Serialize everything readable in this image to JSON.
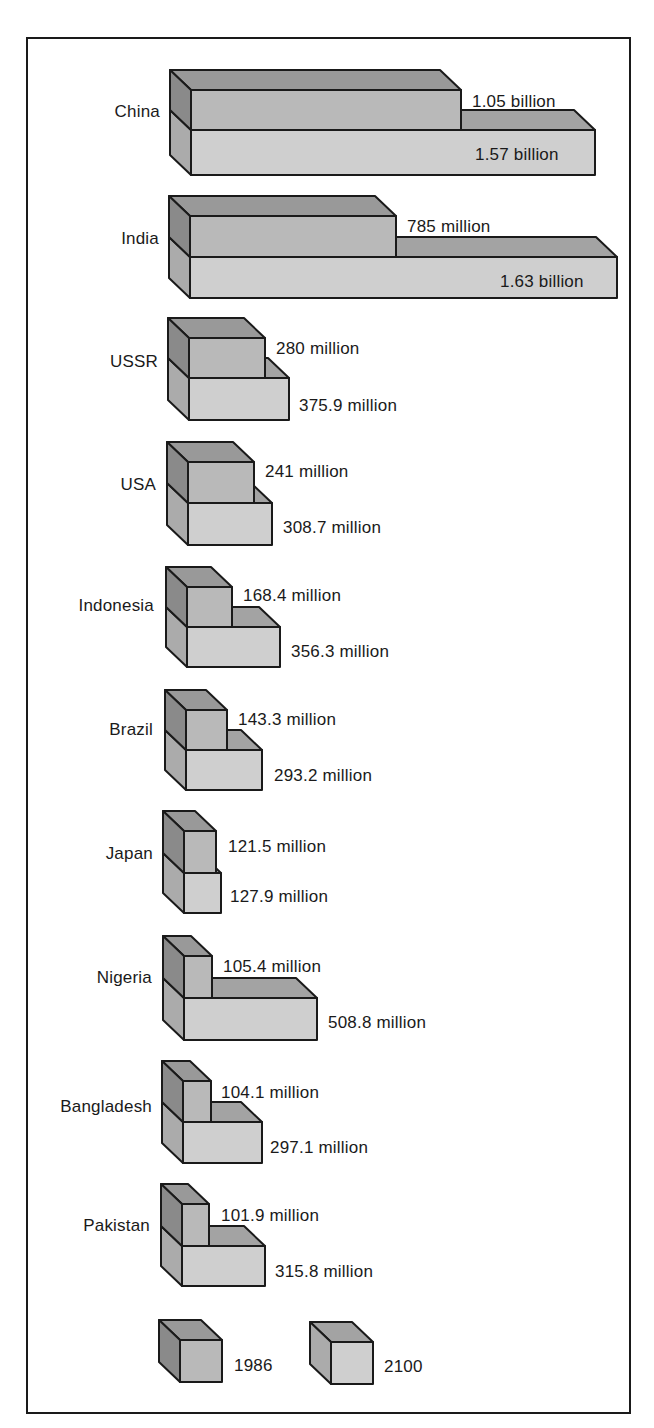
{
  "chart_data": {
    "type": "bar",
    "style": "3d-stacked-blocks",
    "title": "",
    "xlabel": "",
    "ylabel": "",
    "grid": false,
    "legend_position": "bottom",
    "units": "people",
    "categories": [
      "China",
      "India",
      "USSR",
      "USA",
      "Indonesia",
      "Brazil",
      "Japan",
      "Nigeria",
      "Bangladesh",
      "Pakistan"
    ],
    "series": [
      {
        "name": "1986",
        "values": [
          1050000000,
          785000000,
          280000000,
          241000000,
          168400000,
          143300000,
          121500000,
          105400000,
          104100000,
          101900000
        ],
        "labels": [
          "1.05 billion",
          "785 million",
          "280 million",
          "241 million",
          "168.4 million",
          "143.3 million",
          "121.5 million",
          "105.4 million",
          "104.1 million",
          "101.9 million"
        ]
      },
      {
        "name": "2100",
        "values": [
          1570000000,
          1630000000,
          375900000,
          308700000,
          356300000,
          293200000,
          127900000,
          508800000,
          297100000,
          315800000
        ],
        "labels": [
          "1.57 billion",
          "1.63 billion",
          "375.9 million",
          "308.7 million",
          "356.3 million",
          "293.2 million",
          "127.9 million",
          "508.8 million",
          "297.1 million",
          "315.8 million"
        ]
      }
    ]
  },
  "colors": {
    "top_front": "#b9b9b9",
    "top_side": "#8a8a8a",
    "top_top": "#999999",
    "bottom_front": "#cfcfcf",
    "bottom_side": "#ababab",
    "bottom_top": "#a3a3a3",
    "stroke": "#1a1a1a",
    "text": "#1a1a1a"
  },
  "layout": {
    "depth_dx": 21,
    "depth_dy": 20,
    "rows": [
      {
        "fx": 191,
        "fy": 90,
        "top_w": 270,
        "top_h": 40,
        "bot_w": 404,
        "bot_h": 45,
        "label_x": 160,
        "label_y": 103,
        "v1_x": 472,
        "v1_y": 93,
        "v2_x": 475,
        "v2_y": 146,
        "v2_inside": true
      },
      {
        "fx": 190,
        "fy": 216,
        "top_w": 206,
        "top_h": 41,
        "bot_w": 427,
        "bot_h": 41,
        "label_x": 159,
        "label_y": 230,
        "v1_x": 407,
        "v1_y": 218,
        "v2_x": 500,
        "v2_y": 273,
        "v2_inside": true
      },
      {
        "fx": 189,
        "fy": 338,
        "top_w": 76,
        "top_h": 40,
        "bot_w": 100,
        "bot_h": 42,
        "label_x": 158,
        "label_y": 353,
        "v1_x": 276,
        "v1_y": 340,
        "v2_x": 299,
        "v2_y": 397
      },
      {
        "fx": 188,
        "fy": 462,
        "top_w": 66,
        "top_h": 41,
        "bot_w": 84,
        "bot_h": 42,
        "label_x": 156,
        "label_y": 476,
        "v1_x": 265,
        "v1_y": 463,
        "v2_x": 283,
        "v2_y": 519
      },
      {
        "fx": 187,
        "fy": 587,
        "top_w": 45,
        "top_h": 40,
        "bot_w": 93,
        "bot_h": 40,
        "label_x": 154,
        "label_y": 597,
        "v1_x": 243,
        "v1_y": 587,
        "v2_x": 291,
        "v2_y": 643
      },
      {
        "fx": 186,
        "fy": 710,
        "top_w": 41,
        "top_h": 40,
        "bot_w": 76,
        "bot_h": 40,
        "label_x": 153,
        "label_y": 721,
        "v1_x": 238,
        "v1_y": 711,
        "v2_x": 274,
        "v2_y": 767
      },
      {
        "fx": 184,
        "fy": 831,
        "top_w": 32,
        "top_h": 42,
        "bot_w": 37,
        "bot_h": 40,
        "label_x": 153,
        "label_y": 845,
        "v1_x": 228,
        "v1_y": 838,
        "v2_x": 230,
        "v2_y": 888
      },
      {
        "fx": 184,
        "fy": 956,
        "top_w": 28,
        "top_h": 42,
        "bot_w": 133,
        "bot_h": 42,
        "label_x": 152,
        "label_y": 969,
        "v1_x": 223,
        "v1_y": 958,
        "v2_x": 328,
        "v2_y": 1014
      },
      {
        "fx": 183,
        "fy": 1081,
        "top_w": 28,
        "top_h": 41,
        "bot_w": 79,
        "bot_h": 41,
        "label_x": 152,
        "label_y": 1098,
        "v1_x": 221,
        "v1_y": 1084,
        "v2_x": 270,
        "v2_y": 1139
      },
      {
        "fx": 182,
        "fy": 1204,
        "top_w": 27,
        "top_h": 42,
        "bot_w": 83,
        "bot_h": 40,
        "label_x": 150,
        "label_y": 1217,
        "v1_x": 221,
        "v1_y": 1207,
        "v2_x": 275,
        "v2_y": 1263
      }
    ],
    "legend": [
      {
        "fx": 180,
        "fy": 1340,
        "w": 42,
        "h": 42,
        "label_x": 234,
        "label_y": 1357,
        "tone": "top"
      },
      {
        "fx": 331,
        "fy": 1342,
        "w": 42,
        "h": 42,
        "label_x": 384,
        "label_y": 1358,
        "tone": "bottom"
      }
    ]
  },
  "legend": {
    "items": [
      {
        "label": "1986",
        "icon": "dark-cube-icon"
      },
      {
        "label": "2100",
        "icon": "light-cube-icon"
      }
    ]
  }
}
